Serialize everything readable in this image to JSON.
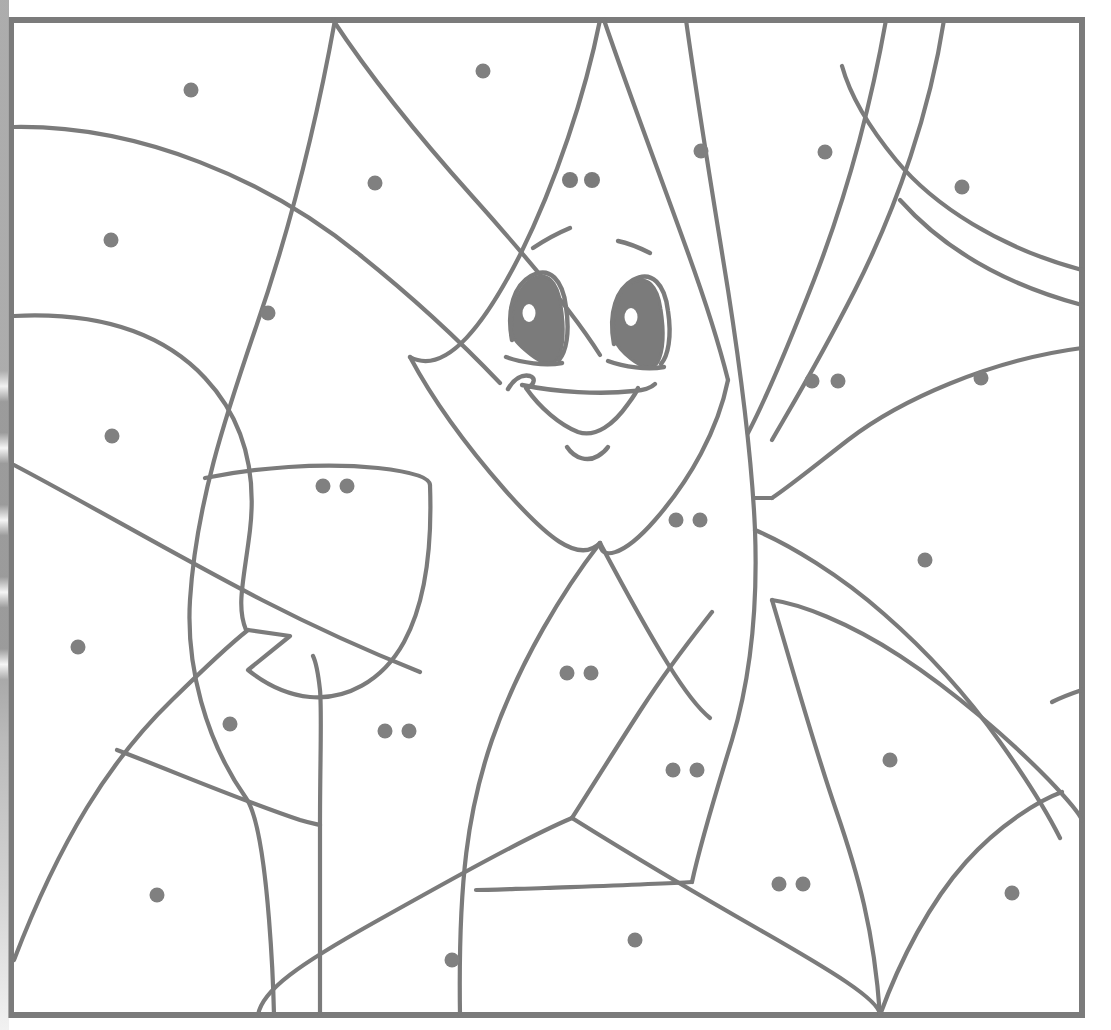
{
  "page": {
    "kind": "color-by-number coloring page",
    "width": 1111,
    "height": 1030,
    "background_color": "#ffffff"
  },
  "style": {
    "line_color": "#7b7b7b",
    "dot_color": "#808080",
    "border_color": "#7b7b7b",
    "line_width": 4.2,
    "border_width": 6,
    "dot_radius": 7.5
  },
  "frame": {
    "x": 8,
    "y": 17,
    "width": 1077,
    "height": 1001
  },
  "artifact": {
    "name": "binding-shadow",
    "description": "vertical dashed gray scan smudge along the left paper edge"
  },
  "face": {
    "description": "cartoon character face with two eyebrows, two large almond eyes with highlights, a triangular nose, a wide smile and a chin curve",
    "nostril_dots": 2,
    "eye_count": 2,
    "eyebrow_count": 2
  },
  "chart_data": {
    "type": "scatter",
    "xlabel": "x (px)",
    "ylabel": "y (px)",
    "xlim": [
      0,
      1111
    ],
    "ylim": [
      0,
      1030
    ],
    "grid": false,
    "legend": "none",
    "note": "Each region of the drawing carries 1 or 2 gray dots encoding its fill color number.",
    "series": [
      {
        "name": "single-dot regions (code 1)",
        "count": 21,
        "points": [
          [
            191,
            90
          ],
          [
            375,
            183
          ],
          [
            111,
            240
          ],
          [
            268,
            313
          ],
          [
            112,
            436
          ],
          [
            483,
            71
          ],
          [
            701,
            151
          ],
          [
            825,
            152
          ],
          [
            962,
            187
          ],
          [
            981,
            378
          ],
          [
            925,
            560
          ],
          [
            78,
            647
          ],
          [
            230,
            724
          ],
          [
            890,
            760
          ],
          [
            157,
            895
          ],
          [
            452,
            960
          ],
          [
            635,
            940
          ],
          [
            1012,
            893
          ]
        ]
      },
      {
        "name": "double-dot regions (code 2)",
        "count": 9,
        "pairs": [
          [
            [
              323,
              486
            ],
            [
              345,
              486
            ]
          ],
          [
            [
              812,
              381
            ],
            [
              838,
              381
            ]
          ],
          [
            [
              676,
              520
            ],
            [
              699,
              520
            ]
          ],
          [
            [
              567,
              673
            ],
            [
              590,
              673
            ]
          ],
          [
            [
              385,
              731
            ],
            [
              408,
              731
            ]
          ],
          [
            [
              673,
              770
            ],
            [
              697,
              770
            ]
          ],
          [
            [
              779,
              884
            ],
            [
              802,
              884
            ]
          ],
          [
            [
              570,
              180
            ],
            [
              590,
              180
            ]
          ]
        ]
      }
    ]
  },
  "dots": {
    "single_label": "color-code-dot",
    "pair_label": "color-code-dot-pair",
    "total_single": 18,
    "total_pairs": 8
  }
}
